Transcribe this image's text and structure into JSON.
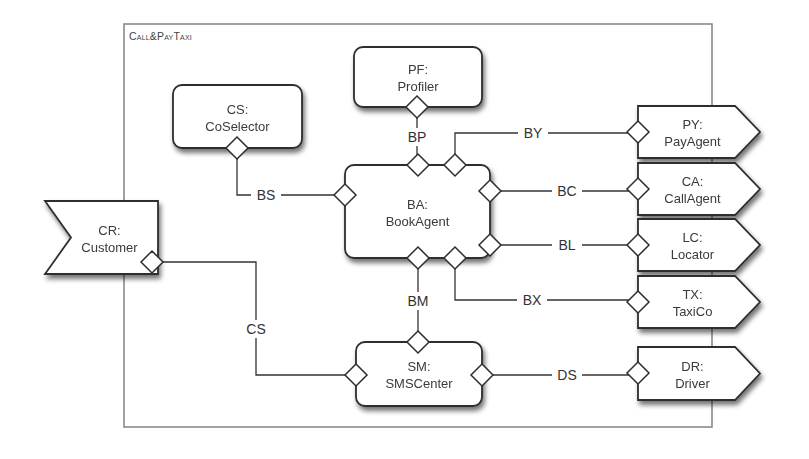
{
  "diagram": {
    "title": "Call&PayTaxi",
    "frame": {
      "x": 124,
      "y": 24,
      "w": 588,
      "h": 403
    },
    "colors": {
      "stroke": "#2e2e2e",
      "frame_stroke": "#8a8a8a",
      "fill": "#ffffff",
      "text": "#3a3a3a"
    },
    "parts": [
      {
        "id": "PF",
        "name": "Profiler",
        "line1": "PF:",
        "line2": "Profiler",
        "shape": "rounded",
        "x": 354,
        "y": 47,
        "w": 128,
        "h": 60
      },
      {
        "id": "CS",
        "name": "CoSelector",
        "line1": "CS:",
        "line2": "CoSelector",
        "shape": "rounded",
        "x": 173,
        "y": 85,
        "w": 129,
        "h": 63
      },
      {
        "id": "BA",
        "name": "BookAgent",
        "line1": "BA:",
        "line2": "BookAgent",
        "shape": "rounded",
        "x": 345,
        "y": 165,
        "w": 145,
        "h": 93
      },
      {
        "id": "SM",
        "name": "SMSCenter",
        "line1": "SM:",
        "line2": "SMSCenter",
        "shape": "rounded",
        "x": 356,
        "y": 342,
        "w": 126,
        "h": 64
      },
      {
        "id": "CR",
        "name": "Customer",
        "line1": "CR:",
        "line2": "Customer",
        "shape": "notched",
        "x": 45,
        "y": 201,
        "w": 113,
        "h": 73
      },
      {
        "id": "PY",
        "name": "PayAgent",
        "line1": "PY:",
        "line2": "PayAgent",
        "shape": "arrow",
        "x": 638,
        "y": 106,
        "w": 122,
        "h": 52
      },
      {
        "id": "CA",
        "name": "CallAgent",
        "line1": "CA:",
        "line2": "CallAgent",
        "shape": "arrow",
        "x": 638,
        "y": 163,
        "w": 122,
        "h": 52
      },
      {
        "id": "LC",
        "name": "Locator",
        "line1": "LC:",
        "line2": "Locator",
        "shape": "arrow",
        "x": 638,
        "y": 219,
        "w": 122,
        "h": 52
      },
      {
        "id": "TX",
        "name": "TaxiCo",
        "line1": "TX:",
        "line2": "TaxiCo",
        "shape": "arrow",
        "x": 638,
        "y": 276,
        "w": 122,
        "h": 52
      },
      {
        "id": "DR",
        "name": "Driver",
        "line1": "DR:",
        "line2": "Driver",
        "shape": "arrow",
        "x": 638,
        "y": 347,
        "w": 122,
        "h": 53
      }
    ],
    "ports": [
      {
        "owner": "PF",
        "x": 417,
        "y": 107
      },
      {
        "owner": "CS",
        "x": 237,
        "y": 148
      },
      {
        "owner": "BA",
        "x": 418,
        "y": 165
      },
      {
        "owner": "BA",
        "x": 455,
        "y": 165
      },
      {
        "owner": "BA",
        "x": 345,
        "y": 195
      },
      {
        "owner": "BA",
        "x": 490,
        "y": 191
      },
      {
        "owner": "BA",
        "x": 490,
        "y": 245
      },
      {
        "owner": "BA",
        "x": 418,
        "y": 258
      },
      {
        "owner": "BA",
        "x": 455,
        "y": 258
      },
      {
        "owner": "CR",
        "x": 152,
        "y": 262
      },
      {
        "owner": "SM",
        "x": 418,
        "y": 342
      },
      {
        "owner": "SM",
        "x": 356,
        "y": 375
      },
      {
        "owner": "SM",
        "x": 482,
        "y": 375
      },
      {
        "owner": "PY",
        "x": 638,
        "y": 132
      },
      {
        "owner": "CA",
        "x": 638,
        "y": 189
      },
      {
        "owner": "LC",
        "x": 638,
        "y": 245
      },
      {
        "owner": "TX",
        "x": 638,
        "y": 302
      },
      {
        "owner": "DR",
        "x": 638,
        "y": 373
      }
    ],
    "connectors": [
      {
        "label": "BP",
        "from": "PF",
        "to": "BA",
        "points": [
          [
            417,
            107
          ],
          [
            417,
            165
          ]
        ],
        "label_x": 417,
        "label_y": 137
      },
      {
        "label": "BS",
        "from": "CS",
        "to": "BA",
        "points": [
          [
            237,
            148
          ],
          [
            237,
            195
          ],
          [
            345,
            195
          ]
        ],
        "label_x": 266,
        "label_y": 195
      },
      {
        "label": "BY",
        "from": "BA",
        "to": "PY",
        "points": [
          [
            455,
            165
          ],
          [
            455,
            133
          ],
          [
            638,
            133
          ]
        ],
        "label_x": 533,
        "label_y": 133
      },
      {
        "label": "BC",
        "from": "BA",
        "to": "CA",
        "points": [
          [
            490,
            191
          ],
          [
            638,
            191
          ]
        ],
        "label_x": 567,
        "label_y": 191
      },
      {
        "label": "BL",
        "from": "BA",
        "to": "LC",
        "points": [
          [
            490,
            245
          ],
          [
            638,
            245
          ]
        ],
        "label_x": 567,
        "label_y": 245
      },
      {
        "label": "BX",
        "from": "BA",
        "to": "TX",
        "points": [
          [
            455,
            258
          ],
          [
            455,
            300
          ],
          [
            638,
            300
          ]
        ],
        "label_x": 532,
        "label_y": 300
      },
      {
        "label": "BM",
        "from": "BA",
        "to": "SM",
        "points": [
          [
            418,
            258
          ],
          [
            418,
            342
          ]
        ],
        "label_x": 418,
        "label_y": 301
      },
      {
        "label": "CS",
        "from": "CR",
        "to": "SM",
        "points": [
          [
            158,
            262
          ],
          [
            256,
            262
          ],
          [
            256,
            375
          ],
          [
            356,
            375
          ]
        ],
        "label_x": 256,
        "label_y": 329
      },
      {
        "label": "DS",
        "from": "SM",
        "to": "DR",
        "points": [
          [
            482,
            375
          ],
          [
            638,
            375
          ]
        ],
        "label_x": 567,
        "label_y": 375
      }
    ]
  }
}
